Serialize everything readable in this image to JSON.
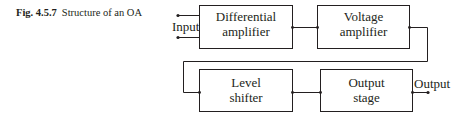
{
  "caption": {
    "figure_number": "Fig. 4.5.7",
    "text": "Structure of an OA"
  },
  "diagram": {
    "input_label": "Input",
    "output_label": "Output",
    "blocks": [
      {
        "id": "differential-amplifier",
        "line1": "Differential",
        "line2": "amplifier"
      },
      {
        "id": "voltage-amplifier",
        "line1": "Voltage",
        "line2": "amplifier"
      },
      {
        "id": "level-shifter",
        "line1": "Level",
        "line2": "shifter"
      },
      {
        "id": "output-stage",
        "line1": "Output",
        "line2": "stage"
      }
    ],
    "connections": [
      {
        "from": "Input",
        "to": "differential-amplifier"
      },
      {
        "from": "differential-amplifier",
        "to": "voltage-amplifier"
      },
      {
        "from": "voltage-amplifier",
        "to": "level-shifter"
      },
      {
        "from": "level-shifter",
        "to": "output-stage"
      },
      {
        "from": "output-stage",
        "to": "Output"
      }
    ]
  }
}
